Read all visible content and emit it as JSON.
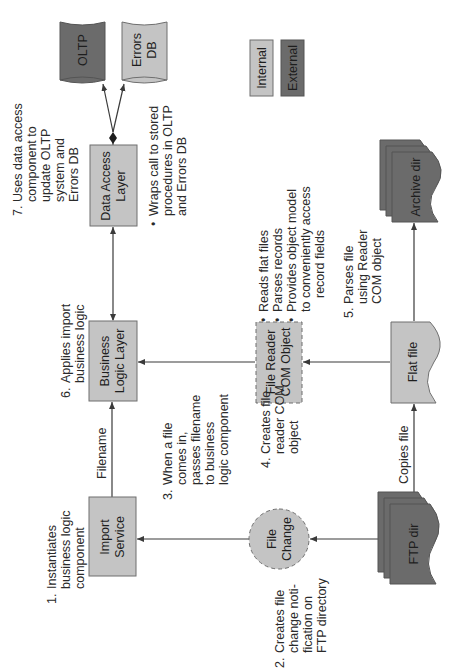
{
  "diagram": {
    "orientation": "rotated-90-ccw",
    "colors": {
      "internal": "#c4c4c4",
      "external": "#6b6b6b",
      "line": "#3a3a3a",
      "text": "#2a2a2a"
    },
    "legend": {
      "internal": "Internal",
      "external": "External"
    },
    "nodes": {
      "import_service": {
        "line1": "Import",
        "line2": "Service",
        "type": "internal"
      },
      "business_logic": {
        "line1": "Business",
        "line2": "Logic Layer",
        "type": "internal"
      },
      "data_access": {
        "line1": "Data Access",
        "line2": "Layer",
        "type": "internal"
      },
      "file_reader": {
        "line1": "File Reader",
        "line2": "COM Object",
        "type": "internal-dashed"
      },
      "file_change": {
        "line1": "File",
        "line2": "Change",
        "type": "internal-circle-dashed"
      },
      "flat_file": {
        "label": "Flat file",
        "type": "internal-document"
      },
      "ftp_dir": {
        "label": "FTP dir",
        "type": "external-multidocument"
      },
      "archive_dir": {
        "label": "Archive dir",
        "type": "external-multidocument"
      },
      "oltp": {
        "label": "OLTP",
        "type": "external-database"
      },
      "errors_db": {
        "line1": "Errors",
        "line2": "DB",
        "type": "internal-database"
      }
    },
    "edges": {
      "filename": "Filename",
      "copies_file": "Copies file"
    },
    "steps": {
      "s1": {
        "num": "1.",
        "lines": [
          "Instantiates",
          "business logic",
          "component"
        ]
      },
      "s2": {
        "num": "2.",
        "lines": [
          "Creates file",
          "change noti-",
          "fication on",
          "FTP directory"
        ]
      },
      "s3": {
        "num": "3.",
        "lines": [
          "When a file",
          "comes in,",
          "passes filename",
          "to business",
          "logic component"
        ]
      },
      "s4": {
        "num": "4.",
        "lines": [
          "Creates file",
          "reader COM",
          "object"
        ]
      },
      "s5": {
        "num": "5.",
        "lines": [
          "Parses file",
          "using Reader",
          "COM object"
        ]
      },
      "s6": {
        "num": "6.",
        "lines": [
          "Applies import",
          "business logic"
        ]
      },
      "s7": {
        "num": "7.",
        "lines": [
          "Uses data access",
          "component to",
          "update OLTP",
          "system and",
          "Errors DB"
        ]
      }
    },
    "notes": {
      "data_access": [
        "Wraps call to stored",
        "procedures in OLTP",
        "and Errors DB"
      ],
      "file_reader": {
        "b1": "Reads flat files",
        "b2": "Parses records",
        "b3a": "Provides object model",
        "b3b": "to conveniently access",
        "b3c": "record fields"
      }
    }
  }
}
